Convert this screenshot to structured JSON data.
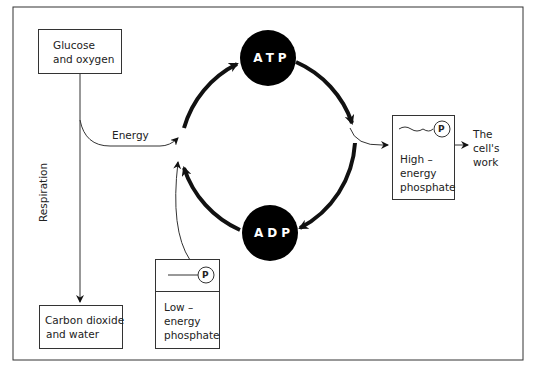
{
  "diagram": {
    "nodes": {
      "glucose": {
        "line1": "Glucose",
        "line2": "and oxygen"
      },
      "carbon": {
        "line1": "Carbon dioxide",
        "line2": "and water"
      },
      "atp": {
        "label": "ATP"
      },
      "adp": {
        "label": "ADP"
      },
      "high_phosphate": {
        "symbol": "P",
        "line1": "High –",
        "line2": "energy",
        "line3": "phosphate"
      },
      "low_phosphate": {
        "symbol": "P",
        "line1": "Low –",
        "line2": "energy",
        "line3": "phosphate"
      },
      "cells_work": {
        "line1": "The",
        "line2": "cell's",
        "line3": "work"
      }
    },
    "edges": {
      "energy": {
        "label": "Energy"
      },
      "respiration": {
        "label": "Respiration"
      }
    }
  }
}
